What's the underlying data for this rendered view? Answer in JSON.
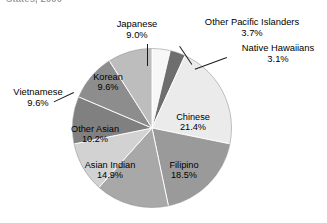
{
  "figure": {
    "title_fragment": "States, 2000",
    "background_color": "#ffffff"
  },
  "chart_data": {
    "type": "pie",
    "title": "States, 2000",
    "xlabel": "",
    "ylabel": "",
    "units": "percent",
    "total": 100.0,
    "start_angle_deg": 0,
    "direction": "clockwise",
    "legend": "none",
    "grid": false,
    "labels_show_percent": true,
    "categories": [
      "Other Pacific Islanders",
      "Native Hawaiians",
      "Chinese",
      "Filipino",
      "Asian Indian",
      "Other Asian",
      "Vietnamese",
      "Korean",
      "Japanese"
    ],
    "values": [
      3.7,
      3.1,
      21.4,
      18.5,
      14.9,
      10.2,
      9.6,
      9.6,
      9.0
    ],
    "colors": [
      "#f7f7f7",
      "#6e6e6e",
      "#ebebeb",
      "#9a9a9a",
      "#a8a8a8",
      "#d2d2d2",
      "#808080",
      "#8d8d8d",
      "#bdbdbd"
    ],
    "slices": [
      {
        "label": "Other Pacific Islanders",
        "value": 3.7,
        "percent_text": "3.7%",
        "color": "#f7f7f7",
        "label_position": "outside"
      },
      {
        "label": "Native Hawaiians",
        "value": 3.1,
        "percent_text": "3.1%",
        "color": "#6e6e6e",
        "label_position": "outside"
      },
      {
        "label": "Chinese",
        "value": 21.4,
        "percent_text": "21.4%",
        "color": "#ebebeb",
        "label_position": "inside"
      },
      {
        "label": "Filipino",
        "value": 18.5,
        "percent_text": "18.5%",
        "color": "#9a9a9a",
        "label_position": "inside"
      },
      {
        "label": "Asian Indian",
        "value": 14.9,
        "percent_text": "14.9%",
        "color": "#a8a8a8",
        "label_position": "inside"
      },
      {
        "label": "Other Asian",
        "value": 10.2,
        "percent_text": "10.2%",
        "color": "#d2d2d2",
        "label_position": "inside"
      },
      {
        "label": "Vietnamese",
        "value": 9.6,
        "percent_text": "9.6%",
        "color": "#808080",
        "label_position": "outside"
      },
      {
        "label": "Korean",
        "value": 9.6,
        "percent_text": "9.6%",
        "color": "#8d8d8d",
        "label_position": "inside"
      },
      {
        "label": "Japanese",
        "value": 9.0,
        "percent_text": "9.0%",
        "color": "#bdbdbd",
        "label_position": "outside"
      }
    ]
  },
  "labels": {
    "japanese": {
      "name": "Japanese",
      "percent": "9.0%"
    },
    "other_pacific_islanders": {
      "name": "Other Pacific Islanders",
      "percent": "3.7%"
    },
    "native_hawaiians": {
      "name": "Native Hawaiians",
      "percent": "3.1%"
    },
    "chinese": {
      "name": "Chinese",
      "percent": "21.4%"
    },
    "filipino": {
      "name": "Filipino",
      "percent": "18.5%"
    },
    "asian_indian": {
      "name": "Asian Indian",
      "percent": "14.9%"
    },
    "other_asian": {
      "name": "Other Asian",
      "percent": "10.2%"
    },
    "vietnamese": {
      "name": "Vietnamese",
      "percent": "9.6%"
    },
    "korean": {
      "name": "Korean",
      "percent": "9.6%"
    }
  }
}
